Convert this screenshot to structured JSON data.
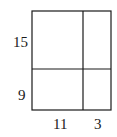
{
  "diagram": {
    "side_labels": {
      "left_top": "15",
      "left_bottom": "9",
      "bottom_left": "11",
      "bottom_right": "3"
    },
    "line_color": "#1a1a1a"
  }
}
